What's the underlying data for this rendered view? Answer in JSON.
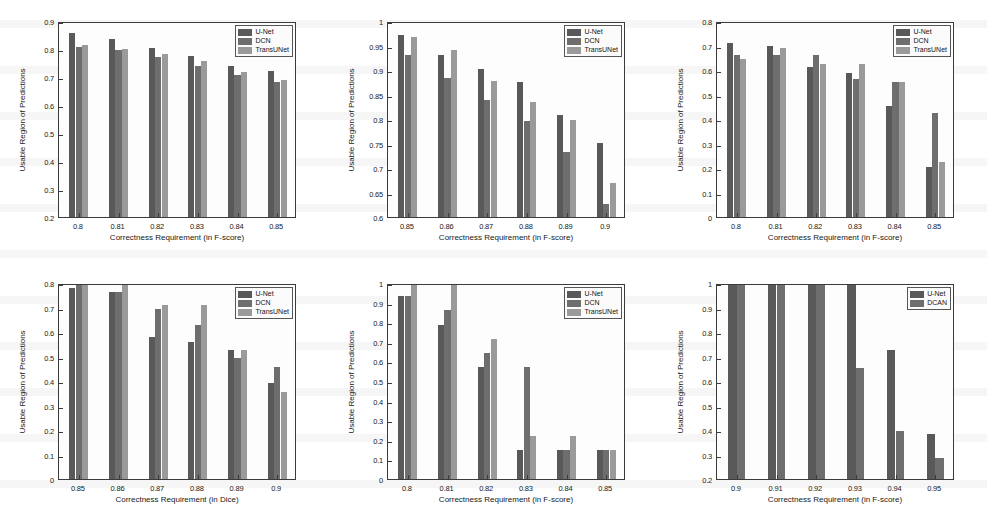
{
  "figure": {
    "series_colors": {
      "U-Net": "#595959",
      "DCN": "#6e6e6e",
      "TransUNet": "#9a9a9a",
      "DCAN": "#6e6e6e"
    },
    "panel_count": 6
  },
  "chart_data": [
    {
      "type": "bar",
      "panel": "top-left",
      "title": "",
      "xlabel": "Correctness Requirement (in F-score)",
      "ylabel": "Usable Region of Predictions",
      "categories": [
        "0.8",
        "0.81",
        "0.82",
        "0.83",
        "0.84",
        "0.85"
      ],
      "ylim": [
        0.2,
        0.9
      ],
      "yticks": [
        "0.2",
        "0.3",
        "0.4",
        "0.5",
        "0.6",
        "0.7",
        "0.8",
        "0.9"
      ],
      "grid": false,
      "legend": [
        "U-Net",
        "DCN",
        "TransUNet"
      ],
      "legend_position": "top-right",
      "series": [
        {
          "name": "U-Net",
          "values": [
            0.858,
            0.834,
            0.803,
            0.776,
            0.74,
            0.72
          ]
        },
        {
          "name": "DCN",
          "values": [
            0.808,
            0.795,
            0.772,
            0.739,
            0.706,
            0.681
          ]
        },
        {
          "name": "TransUNet",
          "values": [
            0.816,
            0.8,
            0.782,
            0.758,
            0.717,
            0.69
          ]
        }
      ]
    },
    {
      "type": "bar",
      "panel": "top-middle",
      "title": "",
      "xlabel": "Correctness Requirement (in F-score)",
      "ylabel": "Usable Region of Predictions",
      "categories": [
        "0.85",
        "0.86",
        "0.87",
        "0.88",
        "0.89",
        "0.9"
      ],
      "ylim": [
        0.6,
        1.0
      ],
      "yticks": [
        "0.6",
        "0.65",
        "0.7",
        "0.75",
        "0.8",
        "0.85",
        "0.9",
        "0.95",
        "1"
      ],
      "grid": false,
      "legend": [
        "U-Net",
        "DCN",
        "TransUNet"
      ],
      "legend_position": "top-right",
      "series": [
        {
          "name": "U-Net",
          "values": [
            0.971,
            0.931,
            0.903,
            0.876,
            0.809,
            0.752
          ]
        },
        {
          "name": "DCN",
          "values": [
            0.931,
            0.884,
            0.838,
            0.796,
            0.732,
            0.627
          ]
        },
        {
          "name": "TransUNet",
          "values": [
            0.967,
            0.941,
            0.878,
            0.835,
            0.797,
            0.67
          ]
        }
      ]
    },
    {
      "type": "bar",
      "panel": "top-right",
      "title": "",
      "xlabel": "Correctness Requirement (in F-score)",
      "ylabel": "Usable Region of Predictions",
      "categories": [
        "0.8",
        "0.81",
        "0.82",
        "0.83",
        "0.84",
        "0.85"
      ],
      "ylim": [
        0.0,
        0.8
      ],
      "yticks": [
        "0",
        "0.1",
        "0.2",
        "0.3",
        "0.4",
        "0.5",
        "0.6",
        "0.7",
        "0.8"
      ],
      "grid": false,
      "legend": [
        "U-Net",
        "DCN",
        "TransUNet"
      ],
      "legend_position": "top-right",
      "series": [
        {
          "name": "U-Net",
          "values": [
            0.712,
            0.699,
            0.613,
            0.587,
            0.455,
            0.203
          ]
        },
        {
          "name": "DCN",
          "values": [
            0.662,
            0.661,
            0.663,
            0.563,
            0.552,
            0.425
          ]
        },
        {
          "name": "TransUNet",
          "values": [
            0.646,
            0.688,
            0.623,
            0.624,
            0.552,
            0.225
          ]
        }
      ]
    },
    {
      "type": "bar",
      "panel": "bottom-left",
      "title": "",
      "xlabel": "Correctness Requirement (in Dice)",
      "ylabel": "Usable Region of Predictions",
      "categories": [
        "0.85",
        "0.86",
        "0.87",
        "0.88",
        "0.89",
        "0.9"
      ],
      "ylim": [
        0.0,
        0.8
      ],
      "yticks": [
        "0",
        "0.1",
        "0.2",
        "0.3",
        "0.4",
        "0.5",
        "0.6",
        "0.7",
        "0.8"
      ],
      "grid": false,
      "legend": [
        "U-Net",
        "DCN",
        "TransUNet"
      ],
      "legend_position": "top-right",
      "series": [
        {
          "name": "U-Net",
          "values": [
            0.78,
            0.762,
            0.578,
            0.561,
            0.525,
            0.39
          ]
        },
        {
          "name": "DCN",
          "values": [
            0.8,
            0.762,
            0.695,
            0.628,
            0.492,
            0.458
          ]
        },
        {
          "name": "TransUNet",
          "values": [
            0.8,
            0.8,
            0.711,
            0.711,
            0.525,
            0.357
          ]
        }
      ]
    },
    {
      "type": "bar",
      "panel": "bottom-middle",
      "title": "",
      "xlabel": "Correctness Requirement (in F-score)",
      "ylabel": "Usable Region of Predictions",
      "categories": [
        "0.8",
        "0.81",
        "0.82",
        "0.83",
        "0.84",
        "0.85"
      ],
      "ylim": [
        0.0,
        1.0
      ],
      "yticks": [
        "0",
        "0.1",
        "0.2",
        "0.3",
        "0.4",
        "0.5",
        "0.6",
        "0.7",
        "0.8",
        "0.9",
        "1"
      ],
      "grid": false,
      "legend": [
        "U-Net",
        "DCN",
        "TransUNet"
      ],
      "legend_position": "top-right",
      "series": [
        {
          "name": "U-Net",
          "values": [
            0.932,
            0.787,
            0.573,
            0.146,
            0.146,
            0.146
          ]
        },
        {
          "name": "DCN",
          "values": [
            0.932,
            0.861,
            0.641,
            0.573,
            0.146,
            0.146
          ]
        },
        {
          "name": "TransUNet",
          "values": [
            1.0,
            1.0,
            0.716,
            0.218,
            0.218,
            0.146
          ]
        }
      ]
    },
    {
      "type": "bar",
      "panel": "bottom-right",
      "title": "",
      "xlabel": "Correctness Requirement (in F-score)",
      "ylabel": "Usable Region of Predictions",
      "categories": [
        "0.9",
        "0.91",
        "0.92",
        "0.93",
        "0.94",
        "0.95"
      ],
      "ylim": [
        0.2,
        1.0
      ],
      "yticks": [
        "0.2",
        "0.3",
        "0.4",
        "0.5",
        "0.6",
        "0.7",
        "0.8",
        "0.9",
        "1"
      ],
      "grid": false,
      "legend": [
        "U-Net",
        "DCAN"
      ],
      "legend_position": "top-right",
      "series": [
        {
          "name": "U-Net",
          "values": [
            1.0,
            1.0,
            1.0,
            1.0,
            0.725,
            0.385
          ]
        },
        {
          "name": "DCAN",
          "values": [
            1.0,
            1.0,
            1.0,
            0.655,
            0.395,
            0.285
          ]
        }
      ]
    }
  ]
}
